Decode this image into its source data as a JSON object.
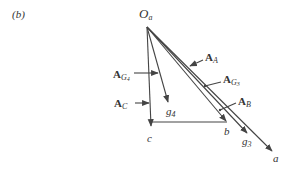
{
  "figure": {
    "panel_label": "(b)",
    "origin_label": {
      "main": "O",
      "sub": "a"
    },
    "points": [
      {
        "id": "c",
        "label": "c"
      },
      {
        "id": "g4",
        "main": "g",
        "sub": "4"
      },
      {
        "id": "b",
        "label": "b"
      },
      {
        "id": "g3",
        "main": "g",
        "sub": "3"
      },
      {
        "id": "a",
        "label": "a"
      }
    ],
    "vectors": [
      {
        "id": "A_A",
        "main": "A",
        "sub": "A"
      },
      {
        "id": "A_G3",
        "main": "A",
        "sub": "G",
        "subsub": "3"
      },
      {
        "id": "A_B",
        "main": "A",
        "sub": "B"
      },
      {
        "id": "A_G4",
        "main": "A",
        "sub": "G",
        "subsub": "4"
      },
      {
        "id": "A_C",
        "main": "A",
        "sub": "C"
      }
    ],
    "colors": {
      "line": "#444444",
      "background": "#ffffff"
    }
  }
}
